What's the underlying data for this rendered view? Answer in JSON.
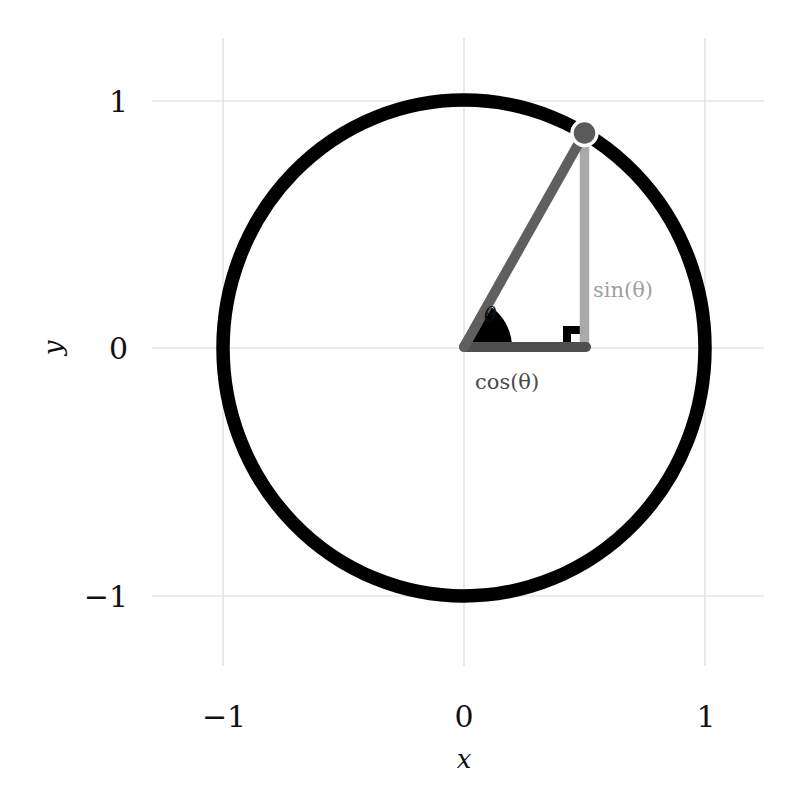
{
  "diagram": {
    "x_axis": {
      "label": "x",
      "ticks": [
        {
          "value": -1,
          "label": "−1"
        },
        {
          "value": 0,
          "label": "0"
        },
        {
          "value": 1,
          "label": "1"
        }
      ]
    },
    "y_axis": {
      "label": "y",
      "ticks": [
        {
          "value": 1,
          "label": "1"
        },
        {
          "value": 0,
          "label": "0"
        },
        {
          "value": -1,
          "label": "−1"
        }
      ]
    },
    "annotations": {
      "angle": "θ",
      "sin_label": "sin(θ)",
      "cos_label": "cos(θ)"
    },
    "angle_degrees": 60,
    "point": {
      "x": 0.5,
      "y": 0.866
    },
    "colors": {
      "circle": "#000000",
      "hypotenuse": "#5f5f5f",
      "sin_leg": "#aaaaaa",
      "cos_leg": "#4f4f4f",
      "point_fill": "#5a5a5a",
      "grid": "#d9d9d9",
      "angle_wedge": "#000000",
      "sin_text": "#a0a0a0",
      "cos_text": "#4a4a4a"
    }
  }
}
